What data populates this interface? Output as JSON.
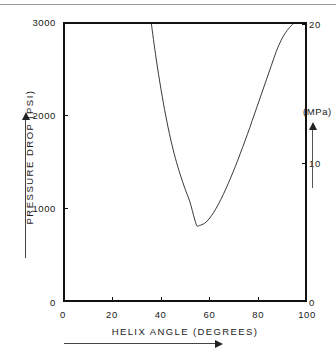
{
  "figure": {
    "background": "#ffffff",
    "line_color": "#222222",
    "axis_color": "#111111",
    "page_rule": true
  },
  "chart_data": {
    "type": "line",
    "title": "",
    "xlabel": "HELIX  ANGLE    (DEGREES)",
    "ylabel": "PRESSURE  DROP    (PSI)",
    "y2label": "(MPa)",
    "xlim": [
      0,
      100
    ],
    "ylim": [
      0,
      3000
    ],
    "y2lim": [
      0,
      20.684
    ],
    "grid": false,
    "legend": null,
    "x_ticks": [
      0,
      20,
      40,
      60,
      80,
      100
    ],
    "x_tick_labels": [
      "0",
      "20",
      "40",
      "60",
      "80",
      "100"
    ],
    "y_ticks": [
      0,
      1000,
      2000,
      3000
    ],
    "y_tick_labels": [
      "0",
      "1000",
      "2000",
      "3000"
    ],
    "y2_ticks": [
      0,
      10,
      20
    ],
    "y2_tick_labels": [
      "0",
      "10",
      "20"
    ],
    "minimum": {
      "x": 55,
      "y": 800
    },
    "x": [
      36,
      38,
      40,
      42,
      44,
      46,
      48,
      50,
      52,
      54,
      55,
      56,
      58,
      60,
      62,
      64,
      66,
      68,
      70,
      72,
      74,
      76,
      78,
      80,
      82,
      84,
      86,
      88,
      90,
      92,
      94,
      95
    ],
    "values": [
      3000,
      2620,
      2290,
      2000,
      1750,
      1540,
      1365,
      1210,
      1070,
      880,
      805,
      810,
      830,
      880,
      955,
      1045,
      1150,
      1265,
      1390,
      1520,
      1660,
      1800,
      1950,
      2100,
      2250,
      2400,
      2550,
      2700,
      2820,
      2910,
      2975,
      3000
    ]
  },
  "axes": {
    "y_labels": [
      "3000",
      "2000",
      "1000",
      "0"
    ],
    "y2_labels": [
      "20",
      "10",
      "0"
    ],
    "x_labels": [
      "0",
      "20",
      "40",
      "60",
      "80",
      "100"
    ],
    "y_title": "PRESSURE  DROP    (PSI)",
    "x_title": "HELIX  ANGLE    (DEGREES)",
    "y2_title": "(MPa)"
  }
}
